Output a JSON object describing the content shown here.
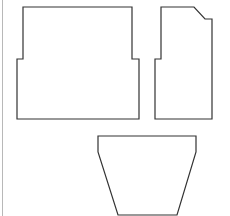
{
  "diagram": {
    "background": "#ffffff",
    "stroke_color": "#333333",
    "edge_line_color": "#b8b8b8",
    "shapes": [
      {
        "name": "left-stepped-panel",
        "points": "23,7 132,7 132,59 139,59 139,119 17,119 17,59 23,59"
      },
      {
        "name": "right-chamfered-panel",
        "points": "161,7 194,7 205,19 212,19 212,119 155,119 155,59 161,59"
      },
      {
        "name": "bottom-trapezoid-panel",
        "points": "98,136 196,136 196,152 177,215 118,215 98,152"
      }
    ]
  }
}
